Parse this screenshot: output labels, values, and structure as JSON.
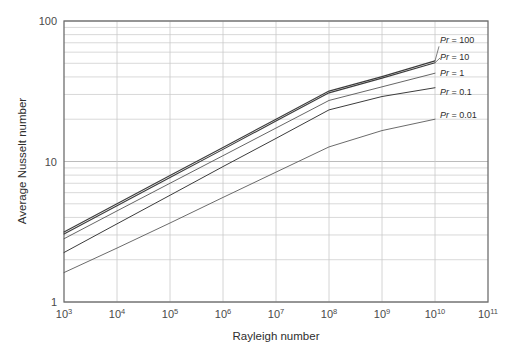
{
  "chart_data": {
    "type": "line",
    "title": "",
    "xlabel": "Rayleigh number",
    "ylabel": "Average Nusselt number",
    "xscale": "log",
    "yscale": "log",
    "xlim": [
      1000,
      100000000000
    ],
    "ylim": [
      1,
      100
    ],
    "grid": true,
    "legend_position": "right-inline",
    "x_tick_labels": [
      "10³",
      "10⁴",
      "10⁵",
      "10⁶",
      "10⁷",
      "10⁸",
      "10⁹",
      "10¹⁰",
      "10¹¹"
    ],
    "x_tick_values": [
      1000,
      10000,
      100000,
      1000000,
      10000000,
      100000000,
      1000000000,
      10000000000,
      100000000000
    ],
    "y_tick_labels": [
      "1",
      "10",
      "100"
    ],
    "y_tick_values": [
      1,
      10,
      100
    ],
    "series": [
      {
        "name": "Pr = 100",
        "label": "Pr = 100",
        "color": "#3c3c3c",
        "width": 1.1,
        "x": [
          1000,
          10000,
          100000,
          1000000,
          10000000,
          100000000,
          1000000000,
          10000000000
        ],
        "y": [
          3.15,
          5.0,
          7.95,
          12.6,
          20.0,
          31.7,
          40.2,
          52.0
        ]
      },
      {
        "name": "Pr = 10",
        "label": "Pr = 10",
        "color": "#3c3c3c",
        "width": 1.1,
        "x": [
          1000,
          10000,
          100000,
          1000000,
          10000000,
          100000000,
          1000000000,
          10000000000
        ],
        "y": [
          3.05,
          4.85,
          7.7,
          12.2,
          19.4,
          30.8,
          39.2,
          50.5
        ]
      },
      {
        "name": "Pr = 1",
        "label": "Pr = 1",
        "color": "#555555",
        "width": 0.9,
        "x": [
          1000,
          10000,
          100000,
          1000000,
          10000000,
          100000000,
          1000000000,
          10000000000
        ],
        "y": [
          2.82,
          4.45,
          7.0,
          11.0,
          17.3,
          27.2,
          34.0,
          42.5
        ]
      },
      {
        "name": "Pr = 0.1",
        "label": "Pr = 0.1",
        "color": "#3c3c3c",
        "width": 1.0,
        "x": [
          1000,
          10000,
          100000,
          1000000,
          10000000,
          100000000,
          1000000000,
          10000000000
        ],
        "y": [
          2.25,
          3.6,
          5.75,
          9.2,
          14.6,
          23.3,
          29.0,
          33.5
        ]
      },
      {
        "name": "Pr = 0.01",
        "label": "Pr = 0.01",
        "color": "#5a5a5a",
        "width": 0.9,
        "x": [
          1000,
          10000,
          100000,
          1000000,
          10000000,
          100000000,
          1000000000,
          10000000000
        ],
        "y": [
          1.62,
          2.42,
          3.65,
          5.55,
          8.4,
          12.7,
          16.6,
          20.0
        ]
      }
    ],
    "annotations": [
      {
        "text": "Pr = 100",
        "value_x": 10000000000,
        "value_y": 73.0
      },
      {
        "text": "Pr = 10",
        "value_x": 10000000000,
        "value_y": 55.0
      },
      {
        "text": "Pr = 1",
        "value_x": 10000000000,
        "value_y": 42.5
      },
      {
        "text": "Pr = 0.1",
        "value_x": 10000000000,
        "value_y": 31.0
      },
      {
        "text": "Pr = 0.01",
        "value_x": 10000000000,
        "value_y": 21.5
      }
    ],
    "style": {
      "grid_color": "#c9c9c9",
      "axis_color": "#6f6f6f",
      "background": "#ffffff"
    }
  }
}
